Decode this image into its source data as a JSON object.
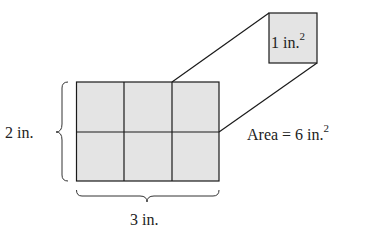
{
  "diagram": {
    "height_label": "2 in.",
    "width_label": "3 in.",
    "unit_square_label": "1 in.",
    "unit_square_exponent": "2",
    "area_label": "Area = 6 in.",
    "area_exponent": "2",
    "grid": {
      "rows": 2,
      "cols": 3
    },
    "colors": {
      "fill": "#e4e4e4",
      "stroke": "#1a1a1a"
    }
  }
}
